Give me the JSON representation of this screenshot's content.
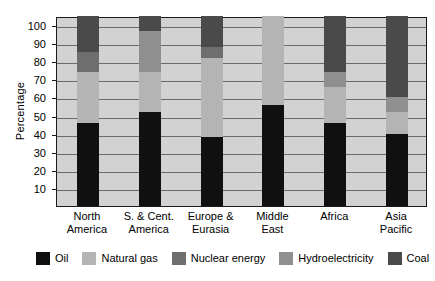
{
  "chart_data": {
    "type": "bar",
    "subtype": "stacked-100-percent",
    "title": "",
    "xlabel": "",
    "ylabel": "Percentage",
    "ylim": [
      0,
      105
    ],
    "yticks": [
      10,
      20,
      30,
      40,
      50,
      60,
      70,
      80,
      90,
      100
    ],
    "grid": true,
    "legend_position": "bottom",
    "categories": [
      "North America",
      "S. & Cent. America",
      "Europe & Eurasia",
      "Middle East",
      "Africa",
      "Asia Pacific"
    ],
    "category_lines": [
      [
        "North",
        "America"
      ],
      [
        "S. & Cent.",
        "America"
      ],
      [
        "Europe &",
        "Eurasia"
      ],
      [
        "Middle",
        "East"
      ],
      [
        "Africa",
        ""
      ],
      [
        "Asia",
        "Pacific"
      ]
    ],
    "series": [
      {
        "name": "Oil",
        "color": "#101010",
        "values": [
          46,
          52,
          38,
          56,
          46,
          40
        ]
      },
      {
        "name": "Natural gas",
        "color": "#b4b4b4",
        "values": [
          28,
          22,
          44,
          49,
          20,
          12
        ]
      },
      {
        "name": "Nuclear energy",
        "color": "#6e6e6e",
        "values": [
          11,
          0,
          6,
          0,
          0,
          0
        ]
      },
      {
        "name": "Hydroelectricity",
        "color": "#8f8f8f",
        "values": [
          0,
          23,
          0,
          0,
          8,
          8
        ]
      },
      {
        "name": "Coal",
        "color": "#4a4a4a",
        "values": [
          20,
          8,
          17,
          0,
          31,
          45
        ]
      }
    ]
  },
  "legend": {
    "items": [
      {
        "label": "Oil",
        "color": "#101010"
      },
      {
        "label": "Natural gas",
        "color": "#b4b4b4"
      },
      {
        "label": "Nuclear energy",
        "color": "#6e6e6e"
      },
      {
        "label": "Hydroelectricity",
        "color": "#8f8f8f"
      },
      {
        "label": "Coal",
        "color": "#4a4a4a"
      }
    ]
  },
  "axes": {
    "y_title": "Percentage",
    "y_tick_labels": [
      "100",
      "90",
      "80",
      "70",
      "60",
      "50",
      "40",
      "30",
      "20",
      "10"
    ]
  },
  "colors": {
    "plot_background": "#d2d2d2",
    "plot_border": "#1a1a1a",
    "gridline": "#6a6a6a",
    "page_background": "#ffffff",
    "text": "#000000"
  }
}
